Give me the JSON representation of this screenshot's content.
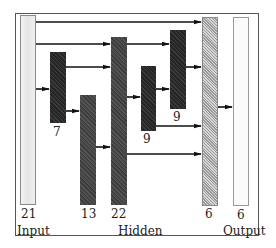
{
  "diagram": {
    "layers": {
      "input_label": "Input",
      "hidden_label": "Hidden",
      "output_label": "Output"
    },
    "blocks": [
      {
        "id": "input",
        "size": "21",
        "style": "light"
      },
      {
        "id": "hidden-a",
        "size": "7",
        "style": "dark"
      },
      {
        "id": "hidden-b",
        "size": "13",
        "style": "dark"
      },
      {
        "id": "hidden-c",
        "size": "22",
        "style": "dark"
      },
      {
        "id": "hidden-d",
        "size": "9",
        "style": "dark"
      },
      {
        "id": "hidden-e",
        "size": "9",
        "style": "dark"
      },
      {
        "id": "hidden-f",
        "size": "6",
        "style": "hatched"
      },
      {
        "id": "output",
        "size": "6",
        "style": "light"
      }
    ],
    "connections": [
      {
        "from": "input",
        "to": "hidden-f"
      },
      {
        "from": "input",
        "to": "hidden-c"
      },
      {
        "from": "input",
        "to": "hidden-a"
      },
      {
        "from": "hidden-a",
        "to": "hidden-c"
      },
      {
        "from": "hidden-a",
        "to": "hidden-b"
      },
      {
        "from": "hidden-b",
        "to": "hidden-c"
      },
      {
        "from": "hidden-c",
        "to": "hidden-e"
      },
      {
        "from": "hidden-c",
        "to": "hidden-d"
      },
      {
        "from": "hidden-c",
        "to": "hidden-f"
      },
      {
        "from": "hidden-d",
        "to": "hidden-e"
      },
      {
        "from": "hidden-d",
        "to": "hidden-f"
      },
      {
        "from": "hidden-e",
        "to": "hidden-f"
      },
      {
        "from": "hidden-f",
        "to": "output"
      }
    ]
  }
}
